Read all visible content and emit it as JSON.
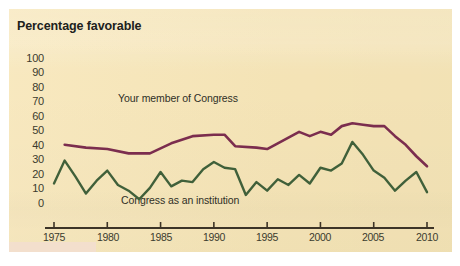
{
  "figure": {
    "title": "Percentage favorable",
    "background_color": "#f7e6b8",
    "page_background": "#ffffff"
  },
  "colors": {
    "member_line": "#7b2d4e",
    "institution_line": "#40603a",
    "axis": "#3d3427",
    "text": "#20211c"
  },
  "chart_data": {
    "type": "line",
    "title": "Percentage favorable",
    "xlabel": "",
    "ylabel": "Percentage favorable",
    "xlim": [
      1975,
      2010
    ],
    "ylim": [
      0,
      100
    ],
    "grid": false,
    "legend_position": "inline-annotations",
    "yticks": [
      0,
      10,
      20,
      30,
      40,
      50,
      60,
      70,
      80,
      90,
      100
    ],
    "xticks": [
      1975,
      1980,
      1985,
      1990,
      1995,
      2000,
      2005,
      2010
    ],
    "annotations": [
      {
        "text": "Your member of Congress",
        "series": "Your member of Congress"
      },
      {
        "text": "Congress as an institution",
        "series": "Congress as an institution"
      }
    ],
    "series": [
      {
        "name": "Your member of Congress",
        "color": "#7b2d4e",
        "x": [
          1976,
          1978,
          1980,
          1982,
          1984,
          1986,
          1988,
          1990,
          1991,
          1992,
          1994,
          1995,
          1996,
          1997,
          1998,
          1999,
          2000,
          2001,
          2002,
          2003,
          2004,
          2005,
          2006,
          2007,
          2008,
          2009,
          2010
        ],
        "values": [
          58,
          56,
          55,
          52,
          52,
          59,
          64,
          65,
          65,
          57,
          56,
          55,
          59,
          63,
          67,
          64,
          67,
          65,
          71,
          73,
          72,
          71,
          71,
          64,
          58,
          50,
          43
        ]
      },
      {
        "name": "Congress as an institution",
        "color": "#40603a",
        "x": [
          1975,
          1976,
          1977,
          1978,
          1979,
          1980,
          1981,
          1982,
          1983,
          1984,
          1985,
          1986,
          1987,
          1988,
          1989,
          1990,
          1991,
          1992,
          1993,
          1994,
          1995,
          1996,
          1997,
          1998,
          1999,
          2000,
          2001,
          2002,
          2003,
          2004,
          2005,
          2006,
          2007,
          2008,
          2009,
          2010
        ],
        "values": [
          31,
          47,
          36,
          24,
          33,
          40,
          30,
          26,
          20,
          28,
          39,
          29,
          33,
          32,
          41,
          46,
          42,
          41,
          23,
          32,
          26,
          34,
          30,
          37,
          31,
          42,
          40,
          45,
          60,
          51,
          40,
          35,
          26,
          33,
          39,
          25
        ]
      }
    ]
  },
  "axes": {
    "y_labels": [
      "100",
      "90",
      "80",
      "70",
      "60",
      "50",
      "40",
      "30",
      "20",
      "10",
      "0"
    ],
    "x_labels": [
      "1975",
      "1980",
      "1985",
      "1990",
      "1995",
      "2000",
      "2005",
      "2010"
    ]
  },
  "labels": {
    "member": "Your member of Congress",
    "institution": "Congress as an institution"
  }
}
